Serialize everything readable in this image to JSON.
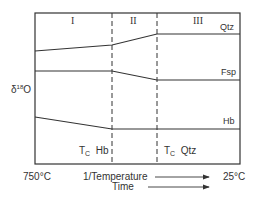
{
  "diagram": {
    "y_axis_label": {
      "prefix": "δ",
      "superscript": "18",
      "suffix": "O"
    },
    "regions": [
      {
        "id": "I",
        "label": "I"
      },
      {
        "id": "II",
        "label": "II"
      },
      {
        "id": "III",
        "label": "III"
      }
    ],
    "series": [
      {
        "name": "Qtz",
        "label": "Qtz",
        "points": [
          [
            35,
            51
          ],
          [
            112,
            45
          ],
          [
            157,
            34
          ],
          [
            240,
            34
          ]
        ]
      },
      {
        "name": "Fsp",
        "label": "Fsp",
        "points": [
          [
            35,
            71
          ],
          [
            112,
            71
          ],
          [
            157,
            80
          ],
          [
            240,
            80
          ]
        ]
      },
      {
        "name": "Hb",
        "label": "Hb",
        "points": [
          [
            35,
            117
          ],
          [
            112,
            129
          ],
          [
            240,
            129
          ]
        ]
      }
    ],
    "closure_labels": [
      {
        "t": "T",
        "sub": "C",
        "mineral": "Hb"
      },
      {
        "t": "T",
        "sub": "C",
        "mineral": "Qtz"
      }
    ],
    "x_left_label": "750°C",
    "x_right_label": "25°C",
    "x_axis_label": "1/Temperature",
    "time_label": "Time",
    "colors": {
      "line": "#333333",
      "background": "#ffffff"
    }
  }
}
